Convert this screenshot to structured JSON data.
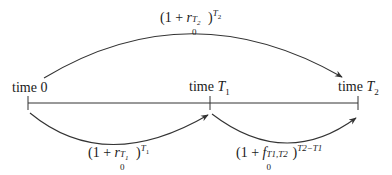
{
  "diagram": {
    "timeline": {
      "ticks": [
        {
          "label_prefix": "time ",
          "label_var": "0",
          "italic": false
        },
        {
          "label_prefix": "time ",
          "label_var": "T",
          "sub": "1",
          "italic": true
        },
        {
          "label_prefix": "time ",
          "label_var": "T",
          "sub": "2",
          "italic": true
        }
      ]
    },
    "arcs": {
      "top": {
        "from": "time 0",
        "to": "time T2",
        "expr_open": "(1 + ",
        "var": "r",
        "sub": "0",
        "sup": "T",
        "sup_sub": "2",
        "close": ")",
        "exp": "T",
        "exp_sub": "2"
      },
      "bottom_left": {
        "from": "time 0",
        "to": "time T1",
        "expr_open": "(1 + ",
        "var": "r",
        "sub": "0",
        "sup": "T",
        "sup_sub": "1",
        "close": ")",
        "exp": "T",
        "exp_sub": "1"
      },
      "bottom_right": {
        "from": "time T1",
        "to": "time T2",
        "expr_open": "(1 + ",
        "var": "f",
        "sub": "0",
        "sup": "T1,T2",
        "close": ")",
        "exp": "T2−T1"
      }
    },
    "colors": {
      "line": "#333333",
      "text": "#1a1a1a",
      "background": "#ffffff"
    }
  }
}
